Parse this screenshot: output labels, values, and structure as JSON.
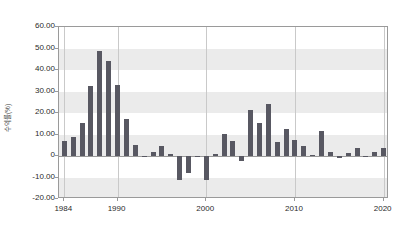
{
  "chart_data": {
    "type": "bar",
    "title": "",
    "xlabel": "",
    "ylabel": "수익률(%)",
    "ylim": [
      -20,
      60
    ],
    "ytick_values": [
      60,
      50,
      40,
      30,
      20,
      10,
      0,
      -10,
      -20
    ],
    "ytick_labels": [
      "60.00",
      "50.00",
      "40.00",
      "30.00",
      "20.00",
      "10.00",
      "0",
      "-10.00",
      "-20.00"
    ],
    "xtick_values": [
      1984,
      1990,
      2000,
      2010,
      2020
    ],
    "xtick_labels": [
      "1984",
      "1990",
      "2000",
      "2010",
      "2020"
    ],
    "xlim": [
      1983.4,
      2020.6
    ],
    "grid": "horizontal-bands-and-vertical-lines",
    "legend": "none",
    "bar_color": "#585862",
    "band_color": "#ebebeb",
    "categories": [
      1984,
      1985,
      1986,
      1987,
      1988,
      1989,
      1990,
      1991,
      1992,
      1993,
      1994,
      1995,
      1996,
      1997,
      1998,
      1999,
      2000,
      2001,
      2002,
      2003,
      2004,
      2005,
      2006,
      2007,
      2008,
      2009,
      2010,
      2011,
      2012,
      2013,
      2014,
      2015,
      2016,
      2017,
      2018,
      2019,
      2020
    ],
    "values": [
      7.0,
      8.8,
      15.3,
      32.5,
      49.0,
      44.2,
      33.0,
      17.0,
      5.0,
      -0.6,
      2.0,
      4.6,
      0.9,
      -11.2,
      -8.0,
      -0.3,
      -11.0,
      0.7,
      10.2,
      7.0,
      -2.3,
      21.5,
      15.2,
      24.0,
      6.3,
      12.7,
      7.6,
      4.5,
      0.4,
      11.5,
      1.9,
      -1.1,
      1.4,
      3.6,
      -0.2,
      2.0,
      3.7
    ],
    "series": [
      {
        "name": "수익률(%)",
        "values": [
          7.0,
          8.8,
          15.3,
          32.5,
          49.0,
          44.2,
          33.0,
          17.0,
          5.0,
          -0.6,
          2.0,
          4.6,
          0.9,
          -11.2,
          -8.0,
          -0.3,
          -11.0,
          0.7,
          10.2,
          7.0,
          -2.3,
          21.5,
          15.2,
          24.0,
          6.3,
          12.7,
          7.6,
          4.5,
          0.4,
          11.5,
          1.9,
          -1.1,
          1.4,
          3.6,
          -0.2,
          2.0,
          3.7
        ]
      }
    ]
  }
}
